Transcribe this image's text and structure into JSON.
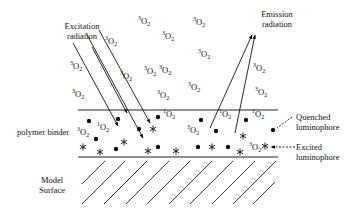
{
  "diagram": {
    "labels": {
      "excitation": [
        "Excitation",
        "radiation"
      ],
      "emission": [
        "Emission",
        "radiation"
      ],
      "polymer_binder": "polymer binder",
      "model_surface": [
        "Model",
        "Surface"
      ],
      "quenched": [
        "Quenched",
        "luminophore"
      ],
      "excited": [
        "Excited",
        "luminophore"
      ]
    },
    "molecule_text": {
      "O": "O",
      "sub": "2"
    },
    "triplet_oxygen_above": [
      {
        "x": 138,
        "y": 22
      },
      {
        "x": 162,
        "y": 37
      },
      {
        "x": 193,
        "y": 23
      },
      {
        "x": 105,
        "y": 42
      },
      {
        "x": 159,
        "y": 71
      },
      {
        "x": 70,
        "y": 67
      },
      {
        "x": 120,
        "y": 77
      },
      {
        "x": 144,
        "y": 72
      },
      {
        "x": 198,
        "y": 55
      },
      {
        "x": 72,
        "y": 95
      },
      {
        "x": 157,
        "y": 96
      },
      {
        "x": 188,
        "y": 88
      },
      {
        "x": 253,
        "y": 69
      },
      {
        "x": 255,
        "y": 93
      }
    ],
    "singlet_oxygen_in_binder": [
      {
        "x": 97,
        "y": 128
      },
      {
        "x": 163,
        "y": 115
      },
      {
        "x": 219,
        "y": 115
      },
      {
        "x": 252,
        "y": 115
      }
    ],
    "triplet_oxygen_in_binder": [
      {
        "x": 77,
        "y": 133
      },
      {
        "x": 187,
        "y": 131
      },
      {
        "x": 249,
        "y": 148
      }
    ],
    "dots": [
      {
        "x": 89,
        "y": 121
      },
      {
        "x": 118,
        "y": 119
      },
      {
        "x": 139,
        "y": 129
      },
      {
        "x": 158,
        "y": 117
      },
      {
        "x": 96,
        "y": 139
      },
      {
        "x": 116,
        "y": 149
      },
      {
        "x": 158,
        "y": 147
      },
      {
        "x": 201,
        "y": 120
      },
      {
        "x": 216,
        "y": 131
      },
      {
        "x": 246,
        "y": 120
      },
      {
        "x": 198,
        "y": 147
      },
      {
        "x": 228,
        "y": 147
      },
      {
        "x": 273,
        "y": 130
      }
    ],
    "stars": [
      {
        "x": 83,
        "y": 147
      },
      {
        "x": 100,
        "y": 152
      },
      {
        "x": 124,
        "y": 142
      },
      {
        "x": 148,
        "y": 151
      },
      {
        "x": 153,
        "y": 129
      },
      {
        "x": 176,
        "y": 151
      },
      {
        "x": 212,
        "y": 147
      },
      {
        "x": 240,
        "y": 152
      },
      {
        "x": 243,
        "y": 136
      },
      {
        "x": 265,
        "y": 146
      }
    ],
    "colors": {
      "ink": "#111111",
      "background": "#ffffff"
    }
  }
}
